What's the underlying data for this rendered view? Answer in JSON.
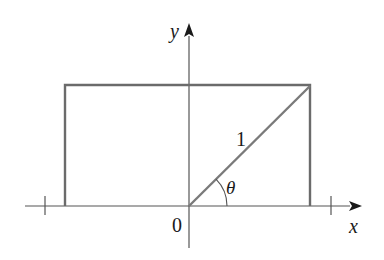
{
  "diagram": {
    "title": "",
    "colors": {
      "axis": "#555555",
      "rectangle": "#6b6b6b",
      "radius": "#7a7a7a",
      "text": "#1a1a1a",
      "background": "#ffffff"
    },
    "axes": {
      "x_label": "x",
      "y_label": "y",
      "origin_label": "0",
      "x_ticks": [
        -1,
        1
      ]
    },
    "radius_label": "1",
    "angle_label": "θ",
    "shapes": [
      {
        "type": "rectangle",
        "description": "rectangle with base on x-axis from x=-cos(θ)... to x=cos(θ), height sin(θ)"
      },
      {
        "type": "segment",
        "from": "origin",
        "to": "top-right corner of rectangle",
        "length_label": "1"
      },
      {
        "type": "arc",
        "description": "angle θ between positive x-axis and radius segment"
      }
    ]
  }
}
